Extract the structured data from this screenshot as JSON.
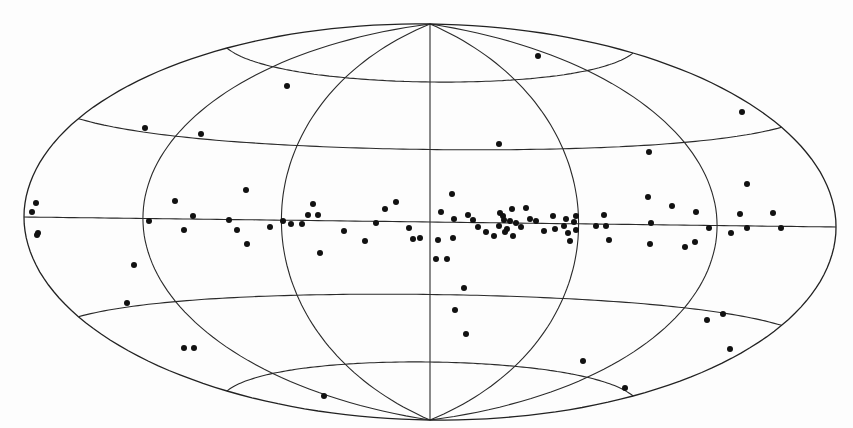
{
  "chart_data": {
    "type": "scatter",
    "projection": "aitoff-hammer all-sky (galactic coordinates)",
    "title": "",
    "xlabel": "",
    "ylabel": "",
    "grid": true,
    "legend": null,
    "graticule": {
      "meridians_deg": [
        -180,
        -120,
        -60,
        0,
        60,
        120,
        180
      ],
      "parallels_deg": [
        -60,
        -30,
        0,
        30,
        60
      ]
    },
    "frame_px": {
      "center": [
        426,
        222
      ],
      "pole_top": [
        426,
        24
      ],
      "pole_bottom": [
        426,
        420
      ],
      "left_edge": [
        24,
        217
      ],
      "right_edge": [
        836,
        226
      ],
      "equator_left_y": 217,
      "equator_right_y": 227
    },
    "points_px": [
      [
        538,
        56
      ],
      [
        287,
        86
      ],
      [
        742,
        112
      ],
      [
        145,
        128
      ],
      [
        499,
        144
      ],
      [
        649,
        152
      ],
      [
        36,
        203
      ],
      [
        32,
        212
      ],
      [
        38,
        233
      ],
      [
        37,
        235
      ],
      [
        246,
        190
      ],
      [
        175,
        201
      ],
      [
        193,
        216
      ],
      [
        149,
        221
      ],
      [
        184,
        230
      ],
      [
        229,
        220
      ],
      [
        237,
        230
      ],
      [
        247,
        244
      ],
      [
        270,
        227
      ],
      [
        283,
        221
      ],
      [
        291,
        224
      ],
      [
        302,
        224
      ],
      [
        313,
        204
      ],
      [
        308,
        215
      ],
      [
        318,
        215
      ],
      [
        320,
        253
      ],
      [
        344,
        231
      ],
      [
        365,
        241
      ],
      [
        376,
        223
      ],
      [
        385,
        209
      ],
      [
        396,
        202
      ],
      [
        409,
        228
      ],
      [
        413,
        239
      ],
      [
        420,
        238
      ],
      [
        452,
        194
      ],
      [
        441,
        212
      ],
      [
        454,
        219
      ],
      [
        453,
        238
      ],
      [
        438,
        240
      ],
      [
        436,
        259
      ],
      [
        447,
        259
      ],
      [
        468,
        215
      ],
      [
        473,
        220
      ],
      [
        478,
        227
      ],
      [
        486,
        232
      ],
      [
        494,
        236
      ],
      [
        499,
        226
      ],
      [
        500,
        213
      ],
      [
        503,
        216
      ],
      [
        504,
        220
      ],
      [
        505,
        232
      ],
      [
        507,
        229
      ],
      [
        510,
        221
      ],
      [
        512,
        209
      ],
      [
        513,
        236
      ],
      [
        516,
        223
      ],
      [
        521,
        227
      ],
      [
        526,
        208
      ],
      [
        530,
        219
      ],
      [
        536,
        221
      ],
      [
        544,
        231
      ],
      [
        553,
        216
      ],
      [
        555,
        229
      ],
      [
        564,
        226
      ],
      [
        566,
        219
      ],
      [
        568,
        233
      ],
      [
        570,
        241
      ],
      [
        574,
        222
      ],
      [
        576,
        216
      ],
      [
        576,
        230
      ],
      [
        596,
        226
      ],
      [
        604,
        215
      ],
      [
        606,
        226
      ],
      [
        609,
        240
      ],
      [
        648,
        197
      ],
      [
        651,
        223
      ],
      [
        650,
        244
      ],
      [
        672,
        206
      ],
      [
        685,
        247
      ],
      [
        696,
        212
      ],
      [
        695,
        242
      ],
      [
        709,
        228
      ],
      [
        731,
        233
      ],
      [
        740,
        214
      ],
      [
        747,
        184
      ],
      [
        747,
        228
      ],
      [
        773,
        213
      ],
      [
        781,
        228
      ],
      [
        134,
        265
      ],
      [
        127,
        303
      ],
      [
        184,
        348
      ],
      [
        194,
        348
      ],
      [
        464,
        288
      ],
      [
        455,
        310
      ],
      [
        466,
        334
      ],
      [
        583,
        361
      ],
      [
        707,
        320
      ],
      [
        723,
        314
      ],
      [
        730,
        349
      ],
      [
        625,
        388
      ],
      [
        324,
        396
      ],
      [
        201,
        134
      ]
    ],
    "point_count": 116,
    "point_style": {
      "color": "#111111",
      "radius_px": 3
    },
    "colors": {
      "background": "#fdfdfd",
      "grid": "#2a2a2a",
      "points": "#111111"
    }
  }
}
